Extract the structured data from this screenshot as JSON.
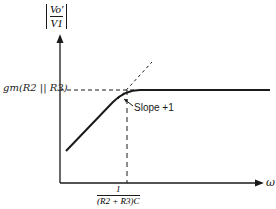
{
  "diagram": {
    "type": "bode-magnitude-asymptotic-plot",
    "y_axis": {
      "label_numerator": "Vo′",
      "label_denominator": "V1",
      "label_text": "|Vo′ / V1|"
    },
    "x_axis": {
      "label": "ω"
    },
    "annotations": {
      "level_label": "gm(R2 || R3)",
      "breakpoint_numerator": "1",
      "breakpoint_denominator": "(R2 + R3)C",
      "slope_label": "Slope +1"
    },
    "colors": {
      "ink": "#1a1a1a",
      "background": "#ffffff"
    }
  }
}
